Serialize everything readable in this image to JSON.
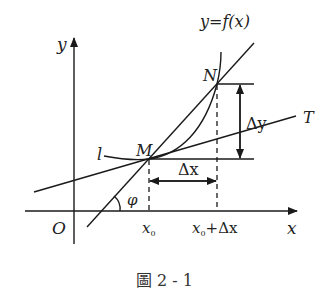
{
  "figure": {
    "caption": "圖 2 - 1",
    "axes": {
      "x_label": "x",
      "y_label": "y",
      "origin_label": "O"
    },
    "curve_label": "y=f(x)",
    "points": {
      "M": "M",
      "N": "N"
    },
    "lines": {
      "tangent_left_label": "l",
      "tangent_right_label": "T"
    },
    "increments": {
      "dx": "Δx",
      "dy": "Δy"
    },
    "angle_label": "φ",
    "ticks": {
      "x0": "x",
      "x0_sub": "0",
      "x0_plus": "x",
      "x0_plus_sub": "0",
      "x0_plus_rest": "+Δx"
    },
    "colors": {
      "stroke": "#1a1a1a",
      "background": "#ffffff"
    }
  }
}
